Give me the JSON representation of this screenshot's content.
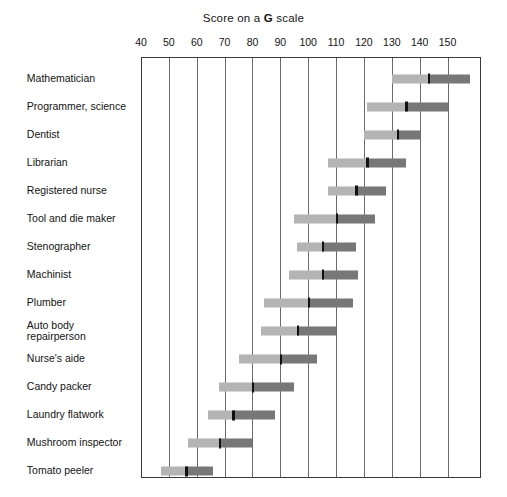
{
  "chart_data": {
    "type": "bar",
    "subtype": "range-bar-with-median",
    "title": "Score on a G scale",
    "title_parts": {
      "before": "Score on a ",
      "emphasis": "G",
      "after": " scale"
    },
    "xlabel": "",
    "ylabel": "",
    "xlim": [
      40,
      162
    ],
    "xticks": [
      40,
      50,
      60,
      70,
      80,
      90,
      100,
      110,
      120,
      130,
      140,
      150
    ],
    "xtick_labels": [
      "40",
      "50",
      "60",
      "70",
      "80",
      "90",
      "100",
      "110",
      "120",
      "130",
      "140",
      "150"
    ],
    "grid": "vertical",
    "legend": "none",
    "categories": [
      "Mathematician",
      "Programmer, science",
      "Dentist",
      "Librarian",
      "Registered nurse",
      "Tool and die maker",
      "Stenographer",
      "Machinist",
      "Plumber",
      "Auto body\nrepairperson",
      "Nurse's aide",
      "Candy packer",
      "Laundry flatwork",
      "Mushroom inspector",
      "Tomato peeler"
    ],
    "series": [
      {
        "name": "range-low-segment",
        "color": "#b4b4b4"
      },
      {
        "name": "range-high-segment",
        "color": "#777777"
      },
      {
        "name": "median-marker",
        "color": "#111111"
      }
    ],
    "rows": [
      {
        "label": "Mathematician",
        "low": 130,
        "median": 143,
        "high": 158
      },
      {
        "label": "Programmer, science",
        "low": 121,
        "median": 135,
        "high": 150
      },
      {
        "label": "Dentist",
        "low": 120,
        "median": 132,
        "high": 140
      },
      {
        "label": "Librarian",
        "low": 107,
        "median": 121,
        "high": 135
      },
      {
        "label": "Registered nurse",
        "low": 107,
        "median": 117,
        "high": 128
      },
      {
        "label": "Tool and die maker",
        "low": 95,
        "median": 110,
        "high": 124
      },
      {
        "label": "Stenographer",
        "low": 96,
        "median": 105,
        "high": 117
      },
      {
        "label": "Machinist",
        "low": 93,
        "median": 105,
        "high": 118
      },
      {
        "label": "Plumber",
        "low": 84,
        "median": 100,
        "high": 116
      },
      {
        "label": "Auto body repairperson",
        "low": 83,
        "median": 96,
        "high": 110
      },
      {
        "label": "Nurse's aide",
        "low": 75,
        "median": 90,
        "high": 103
      },
      {
        "label": "Candy packer",
        "low": 68,
        "median": 80,
        "high": 95
      },
      {
        "label": "Laundry flatwork",
        "low": 64,
        "median": 73,
        "high": 88
      },
      {
        "label": "Mushroom inspector",
        "low": 57,
        "median": 68,
        "high": 80
      },
      {
        "label": "Tomato peeler",
        "low": 47,
        "median": 56,
        "high": 66
      }
    ]
  },
  "colors": {
    "bar_light": "#b4b4b4",
    "bar_dark": "#777777",
    "median": "#111111",
    "gridline": "#6b6b6b",
    "frame": "#3a3a3a",
    "text": "#141414",
    "background": "#ffffff"
  }
}
